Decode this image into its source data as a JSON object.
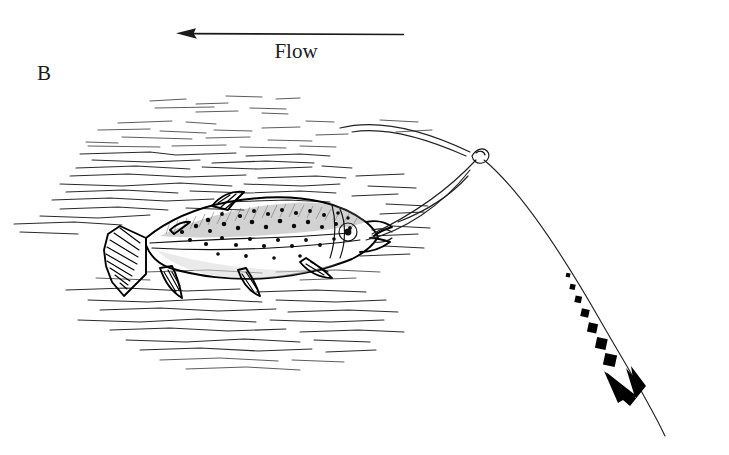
{
  "figure": {
    "panel_label": "B",
    "flow_label": "Flow",
    "background_color": "#ffffff",
    "ink_color": "#1a1a1a",
    "annotations": {
      "flow_arrow_direction": "left",
      "flow_arrow_x_start": 404,
      "flow_arrow_x_end": 178,
      "flow_arrow_y": 34,
      "motion_arrow_direction": "down-right",
      "motion_arrow_style": "dashed-squares-growing"
    },
    "elements": {
      "fish": "trout-drawing",
      "water": "water-surface-hatching",
      "line": "fly-line-curve",
      "knot": "line-loop-knot",
      "motion_arrow": "dashed-motion-arrow"
    }
  }
}
